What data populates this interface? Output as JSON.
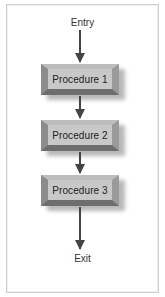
{
  "diagram": {
    "type": "flowchart",
    "entry_label": "Entry",
    "exit_label": "Exit",
    "nodes": [
      {
        "id": "p1",
        "label": "Procedure 1"
      },
      {
        "id": "p2",
        "label": "Procedure 2"
      },
      {
        "id": "p3",
        "label": "Procedure 3"
      }
    ],
    "edges": [
      {
        "from": "Entry",
        "to": "Procedure 1"
      },
      {
        "from": "Procedure 1",
        "to": "Procedure 2"
      },
      {
        "from": "Procedure 2",
        "to": "Procedure 3"
      },
      {
        "from": "Procedure 3",
        "to": "Exit"
      }
    ],
    "colors": {
      "box_face": "#c8c8c8",
      "arrow": "#444444",
      "frame": "#cfcfcf"
    }
  }
}
